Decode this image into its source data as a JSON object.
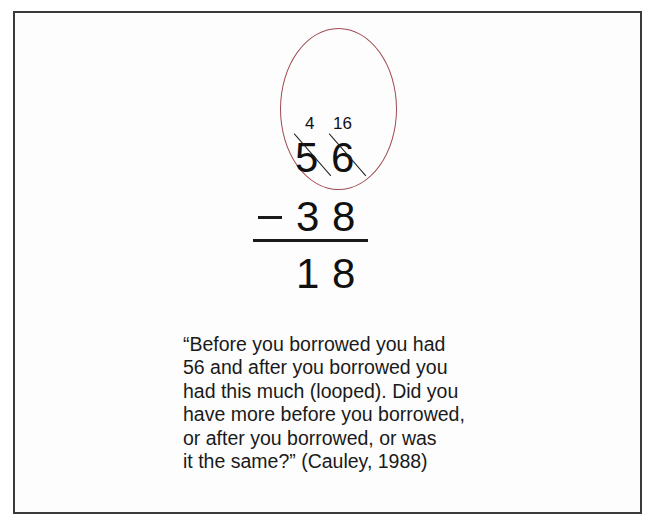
{
  "figure": {
    "problem": {
      "borrow_marks": {
        "tens": "4",
        "ones": "16"
      },
      "minuend": {
        "tens": "5",
        "ones": "6"
      },
      "operator": "−",
      "subtrahend": {
        "tens": "3",
        "ones": "8"
      },
      "difference": {
        "tens": "1",
        "ones": "8"
      },
      "loop_color": "#a04a50"
    },
    "quote": {
      "lines": [
        "“Before you borrowed you had",
        "56 and after you borrowed you",
        "had this much (looped).  Did you",
        "have more before you borrowed,",
        "or after you borrowed, or was",
        "it the same?”  (Cauley, 1988)"
      ]
    }
  }
}
